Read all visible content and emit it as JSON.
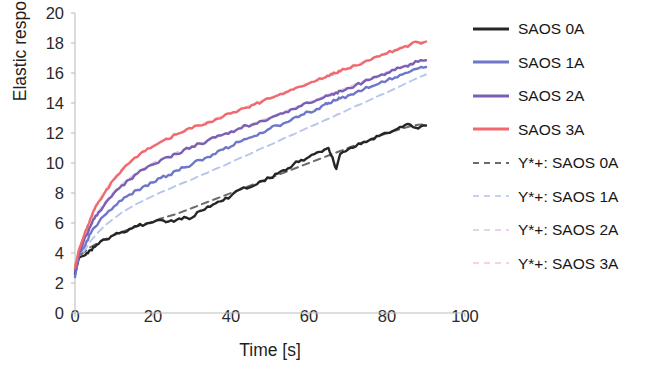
{
  "chart_data": {
    "type": "line",
    "title": "",
    "xlabel": "Time [s]",
    "ylabel": "Elastic response [Pa]",
    "xlim": [
      0,
      100
    ],
    "ylim": [
      0,
      20
    ],
    "xticks": [
      0,
      20,
      40,
      60,
      80,
      100
    ],
    "yticks": [
      0,
      2,
      4,
      6,
      8,
      10,
      12,
      14,
      16,
      18,
      20
    ],
    "grid": false,
    "legend_position": "right",
    "x": [
      0,
      1,
      2,
      3,
      4,
      5,
      6,
      8,
      10,
      12,
      14,
      16,
      18,
      20,
      22,
      24,
      26,
      28,
      30,
      32,
      34,
      36,
      38,
      40,
      42,
      44,
      46,
      48,
      50,
      52,
      54,
      56,
      58,
      60,
      62,
      64,
      65,
      66,
      67,
      68,
      70,
      72,
      74,
      76,
      78,
      80,
      82,
      84,
      86,
      88,
      90
    ],
    "series": [
      {
        "name": "SAOS 0A",
        "style": "solid",
        "color": "#262626",
        "values": [
          2.6,
          3.7,
          3.8,
          4.0,
          4.2,
          4.4,
          4.6,
          4.9,
          5.2,
          5.4,
          5.6,
          5.8,
          5.9,
          6.05,
          6.2,
          6.1,
          6.2,
          6.4,
          6.35,
          6.8,
          7.1,
          7.3,
          7.5,
          7.8,
          8.2,
          8.3,
          8.5,
          8.8,
          9.0,
          9.3,
          9.5,
          9.9,
          10.2,
          10.4,
          10.7,
          10.9,
          11.0,
          10.4,
          9.6,
          10.6,
          10.9,
          11.1,
          11.4,
          11.6,
          11.8,
          12.0,
          12.2,
          12.4,
          12.55,
          12.3,
          12.5
        ]
      },
      {
        "name": "SAOS 1A",
        "style": "solid",
        "color": "#6f77c8",
        "values": [
          2.4,
          3.9,
          4.3,
          4.8,
          5.3,
          5.7,
          6.0,
          6.6,
          7.1,
          7.5,
          7.9,
          8.2,
          8.5,
          8.7,
          9.0,
          9.2,
          9.5,
          9.7,
          9.9,
          10.2,
          10.4,
          10.6,
          10.9,
          11.1,
          11.4,
          11.6,
          11.8,
          12.0,
          12.3,
          12.5,
          12.7,
          13.0,
          13.2,
          13.4,
          13.6,
          13.9,
          14.0,
          14.1,
          14.2,
          14.3,
          14.5,
          14.7,
          14.9,
          15.1,
          15.3,
          15.5,
          15.7,
          15.9,
          16.1,
          16.3,
          16.4
        ]
      },
      {
        "name": "SAOS 2A",
        "style": "solid",
        "color": "#7b5fb5",
        "values": [
          2.8,
          4.0,
          4.6,
          5.2,
          5.8,
          6.3,
          6.7,
          7.4,
          8.0,
          8.5,
          8.9,
          9.3,
          9.6,
          9.9,
          10.2,
          10.4,
          10.6,
          10.9,
          11.1,
          11.3,
          11.5,
          11.7,
          11.9,
          12.1,
          12.3,
          12.5,
          12.6,
          12.8,
          13.0,
          13.2,
          13.4,
          13.6,
          13.8,
          14.0,
          14.2,
          14.4,
          14.5,
          14.6,
          14.7,
          14.8,
          15.0,
          15.2,
          15.4,
          15.6,
          15.8,
          16.0,
          16.2,
          16.4,
          16.6,
          16.75,
          16.85
        ]
      },
      {
        "name": "SAOS 3A",
        "style": "solid",
        "color": "#f0696f",
        "values": [
          3.0,
          4.2,
          4.9,
          5.6,
          6.3,
          6.9,
          7.4,
          8.2,
          8.9,
          9.5,
          10.0,
          10.4,
          10.8,
          11.1,
          11.4,
          11.6,
          11.9,
          12.1,
          12.3,
          12.5,
          12.7,
          12.9,
          13.1,
          13.3,
          13.5,
          13.7,
          13.9,
          14.1,
          14.3,
          14.5,
          14.7,
          14.9,
          15.1,
          15.3,
          15.5,
          15.7,
          15.8,
          15.9,
          16.0,
          16.1,
          16.3,
          16.5,
          16.7,
          16.9,
          17.1,
          17.3,
          17.5,
          17.7,
          17.9,
          18.05,
          18.1
        ]
      },
      {
        "name": "Y*+: SAOS 0A",
        "style": "dashed",
        "color": "#6b6b6b",
        "values": [
          3.2,
          3.8,
          4.0,
          4.2,
          4.4,
          4.55,
          4.7,
          4.95,
          5.2,
          5.4,
          5.6,
          5.78,
          5.95,
          6.1,
          6.3,
          6.45,
          6.6,
          6.8,
          7.0,
          7.2,
          7.4,
          7.6,
          7.8,
          8.0,
          8.2,
          8.4,
          8.6,
          8.8,
          9.0,
          9.2,
          9.4,
          9.6,
          9.8,
          10.0,
          10.2,
          10.4,
          10.5,
          10.6,
          10.7,
          10.8,
          11.0,
          11.2,
          11.4,
          11.6,
          11.8,
          12.0,
          12.15,
          12.3,
          12.45,
          12.55,
          12.6
        ]
      },
      {
        "name": "Y*+: SAOS 1A",
        "style": "dashed",
        "color": "#b8c6ee",
        "values": [
          2.6,
          3.6,
          4.0,
          4.4,
          4.8,
          5.1,
          5.4,
          5.9,
          6.3,
          6.7,
          7.0,
          7.3,
          7.55,
          7.8,
          8.05,
          8.25,
          8.5,
          8.7,
          8.9,
          9.15,
          9.35,
          9.6,
          9.8,
          10.05,
          10.3,
          10.5,
          10.75,
          11.0,
          11.2,
          11.45,
          11.7,
          11.9,
          12.15,
          12.4,
          12.6,
          12.85,
          12.95,
          13.05,
          13.2,
          13.3,
          13.55,
          13.8,
          14.0,
          14.25,
          14.5,
          14.7,
          14.95,
          15.2,
          15.45,
          15.7,
          15.9
        ]
      },
      {
        "name": "Y*+: SAOS 2A",
        "style": "dashed",
        "color": "#e3cfe8",
        "values": [
          3.0,
          4.1,
          4.7,
          5.3,
          5.9,
          6.4,
          6.8,
          7.5,
          8.1,
          8.6,
          9.0,
          9.4,
          9.7,
          10.0,
          10.25,
          10.45,
          10.7,
          10.9,
          11.1,
          11.3,
          11.5,
          11.7,
          11.9,
          12.1,
          12.3,
          12.5,
          12.65,
          12.85,
          13.05,
          13.25,
          13.45,
          13.65,
          13.85,
          14.05,
          14.25,
          14.45,
          14.55,
          14.65,
          14.75,
          14.85,
          15.05,
          15.25,
          15.45,
          15.65,
          15.85,
          16.05,
          16.25,
          16.45,
          16.6,
          16.75,
          16.85
        ]
      },
      {
        "name": "Y*+: SAOS 3A",
        "style": "dashed",
        "color": "#f7cdd8",
        "values": [
          3.1,
          4.3,
          5.0,
          5.7,
          6.4,
          7.0,
          7.5,
          8.3,
          9.0,
          9.6,
          10.1,
          10.5,
          10.85,
          11.15,
          11.45,
          11.65,
          11.95,
          12.15,
          12.35,
          12.55,
          12.75,
          12.95,
          13.15,
          13.35,
          13.55,
          13.75,
          13.95,
          14.15,
          14.35,
          14.55,
          14.75,
          14.95,
          15.15,
          15.35,
          15.55,
          15.75,
          15.85,
          15.95,
          16.05,
          16.15,
          16.35,
          16.55,
          16.75,
          16.95,
          17.15,
          17.35,
          17.55,
          17.75,
          17.9,
          18.05,
          18.1
        ]
      }
    ]
  },
  "legend": {
    "items": [
      {
        "label": "SAOS 0A",
        "color": "#262626",
        "style": "solid"
      },
      {
        "label": "SAOS 1A",
        "color": "#6f77c8",
        "style": "solid"
      },
      {
        "label": "SAOS 2A",
        "color": "#7b5fb5",
        "style": "solid"
      },
      {
        "label": "SAOS 3A",
        "color": "#f0696f",
        "style": "solid"
      },
      {
        "label": "Y*+: SAOS 0A",
        "color": "#6b6b6b",
        "style": "dashed"
      },
      {
        "label": "Y*+: SAOS 1A",
        "color": "#c2d2f0",
        "style": "dashed"
      },
      {
        "label": "Y*+: SAOS 2A",
        "color": "#e6d2ea",
        "style": "dashed"
      },
      {
        "label": "Y*+: SAOS 3A",
        "color": "#f8d3dd",
        "style": "dashed"
      }
    ]
  },
  "axis": {
    "color": "#bdbdbd"
  }
}
